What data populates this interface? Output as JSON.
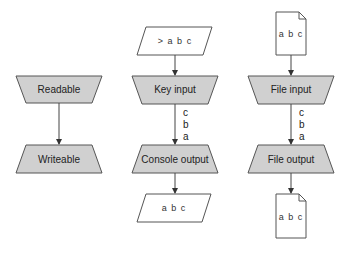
{
  "diagram": {
    "columns": [
      {
        "id": "abstract",
        "nodes": [
          {
            "id": "readable",
            "label": "Readable",
            "shape": "trapezoid-down"
          },
          {
            "id": "writeable",
            "label": "Writeable",
            "shape": "trapezoid-up"
          }
        ],
        "edges": [
          {
            "from": "readable",
            "to": "writeable",
            "labels": []
          }
        ]
      },
      {
        "id": "console",
        "nodes": [
          {
            "id": "console-in-data",
            "label": "> a b c",
            "shape": "parallelogram"
          },
          {
            "id": "key-input",
            "label": "Key input",
            "shape": "trapezoid-down"
          },
          {
            "id": "console-output",
            "label": "Console output",
            "shape": "trapezoid-up"
          },
          {
            "id": "console-out-data",
            "label": "a b c",
            "shape": "parallelogram"
          }
        ],
        "edges": [
          {
            "from": "console-in-data",
            "to": "key-input",
            "labels": []
          },
          {
            "from": "key-input",
            "to": "console-output",
            "labels": [
              "c",
              "b",
              "a"
            ]
          },
          {
            "from": "console-output",
            "to": "console-out-data",
            "labels": []
          }
        ]
      },
      {
        "id": "file",
        "nodes": [
          {
            "id": "file-in-doc",
            "label": "a b c",
            "shape": "document"
          },
          {
            "id": "file-input",
            "label": "File input",
            "shape": "trapezoid-down"
          },
          {
            "id": "file-output",
            "label": "File output",
            "shape": "trapezoid-up"
          },
          {
            "id": "file-out-doc",
            "label": "a b c",
            "shape": "document"
          }
        ],
        "edges": [
          {
            "from": "file-in-doc",
            "to": "file-input",
            "labels": []
          },
          {
            "from": "file-input",
            "to": "file-output",
            "labels": [
              "c",
              "b",
              "a"
            ]
          },
          {
            "from": "file-output",
            "to": "file-out-doc",
            "labels": []
          }
        ]
      }
    ],
    "labels": {
      "readable": "Readable",
      "writeable": "Writeable",
      "console_in": "> a b c",
      "key_input": "Key input",
      "console_output": "Console output",
      "console_out": "a b c",
      "file_in": "a b c",
      "file_input": "File input",
      "file_output": "File output",
      "file_out": "a b c",
      "stream_chars": [
        "c",
        "b",
        "a"
      ]
    },
    "colors": {
      "process_fill": "#d0d0d0",
      "stroke": "#555555",
      "io_fill": "#ffffff"
    }
  }
}
